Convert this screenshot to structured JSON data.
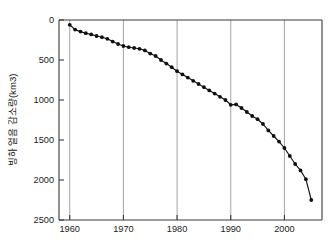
{
  "chart_data": {
    "type": "line",
    "title": "",
    "subtitle": "",
    "xlabel": "",
    "ylabel": "빙하 얼음 감소량(km3)",
    "y_inverted": true,
    "xlim": [
      1958,
      2007
    ],
    "ylim": [
      0,
      2500
    ],
    "grid": "vertical-only",
    "legend": "none",
    "x_ticks": [
      1960,
      1970,
      1980,
      1990,
      2000
    ],
    "x_tick_labels": [
      "1960",
      "1970",
      "1980",
      "1990",
      "2000"
    ],
    "y_ticks": [
      0,
      500,
      1000,
      1500,
      2000,
      2500
    ],
    "y_tick_labels": [
      "0",
      "500",
      "1000",
      "1500",
      "2000",
      "2500"
    ],
    "marker": "filled-circle",
    "line_color": "#111111",
    "marker_color": "#101010",
    "grid_color": "#9a9a9a",
    "axis_color": "#3a3a3a",
    "series": [
      {
        "name": "누적 빙하 얼음 감소량",
        "x": [
          1960,
          1961,
          1962,
          1963,
          1964,
          1965,
          1966,
          1967,
          1968,
          1969,
          1970,
          1971,
          1972,
          1973,
          1974,
          1975,
          1976,
          1977,
          1978,
          1979,
          1980,
          1981,
          1982,
          1983,
          1984,
          1985,
          1986,
          1987,
          1988,
          1989,
          1990,
          1991,
          1992,
          1993,
          1994,
          1995,
          1996,
          1997,
          1998,
          1999,
          2000,
          2001,
          2002,
          2003,
          2004,
          2005
        ],
        "values": [
          60,
          120,
          145,
          165,
          180,
          200,
          215,
          235,
          270,
          300,
          325,
          340,
          350,
          360,
          380,
          420,
          450,
          500,
          545,
          590,
          640,
          680,
          720,
          760,
          800,
          840,
          880,
          920,
          960,
          1000,
          1060,
          1055,
          1100,
          1150,
          1200,
          1240,
          1300,
          1380,
          1450,
          1520,
          1600,
          1700,
          1800,
          1880,
          1990,
          2250
        ]
      }
    ]
  },
  "figure": {
    "background_color": "#ffffff",
    "plot_left": 59,
    "plot_top": 20,
    "plot_right": 322,
    "plot_bottom": 220
  }
}
